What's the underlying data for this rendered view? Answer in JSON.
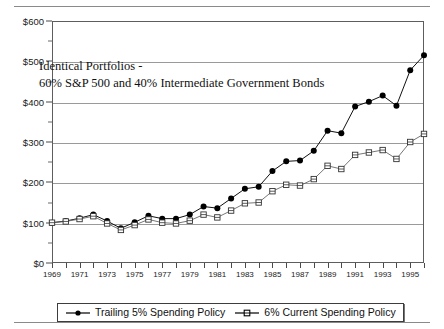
{
  "chart_data": {
    "type": "line",
    "title": "",
    "subtitle": "",
    "xlabel": "",
    "ylabel": "",
    "xlim": [
      1969,
      1996
    ],
    "ylim": [
      0,
      600
    ],
    "grid": true,
    "legend_position": "bottom",
    "y_tick_labels": [
      "$0",
      "$100",
      "$200",
      "$300",
      "$400",
      "$500",
      "$600"
    ],
    "y_ticks": [
      0,
      100,
      200,
      300,
      400,
      500,
      600
    ],
    "x_tick_labels": [
      "1969",
      "1971",
      "1973",
      "1975",
      "1977",
      "1979",
      "1981",
      "1983",
      "1985",
      "1987",
      "1989",
      "1991",
      "1993",
      "1995"
    ],
    "x_ticks": [
      1969,
      1971,
      1973,
      1975,
      1977,
      1979,
      1981,
      1983,
      1985,
      1987,
      1989,
      1991,
      1993,
      1995
    ],
    "x": [
      1969,
      1970,
      1971,
      1972,
      1973,
      1974,
      1975,
      1976,
      1977,
      1978,
      1979,
      1980,
      1981,
      1982,
      1983,
      1984,
      1985,
      1986,
      1987,
      1988,
      1989,
      1990,
      1991,
      1992,
      1993,
      1994,
      1995,
      1996
    ],
    "annotations": [
      "Identical Portfolios -",
      "60% S&P 500 and 40% Intermediate Government Bonds"
    ],
    "series": [
      {
        "name": "Trailing 5% Spending Policy",
        "marker": "filled-circle",
        "color": "#000000",
        "values": [
          100,
          104,
          111,
          120,
          104,
          86,
          101,
          117,
          110,
          110,
          120,
          140,
          136,
          160,
          184,
          189,
          228,
          252,
          254,
          278,
          328,
          322,
          388,
          400,
          415,
          390,
          478,
          515
        ]
      },
      {
        "name": "6% Current Spending Policy",
        "marker": "open-square",
        "color": "#555555",
        "values": [
          100,
          103,
          109,
          116,
          98,
          82,
          94,
          108,
          100,
          98,
          105,
          120,
          113,
          130,
          148,
          150,
          178,
          194,
          192,
          208,
          241,
          233,
          268,
          274,
          280,
          258,
          300,
          320
        ]
      }
    ]
  },
  "legend": {
    "entries": [
      {
        "label": "Trailing 5% Spending Policy",
        "marker": "filled-circle-marker"
      },
      {
        "label": "6% Current Spending Policy",
        "marker": "open-square-marker"
      }
    ]
  }
}
